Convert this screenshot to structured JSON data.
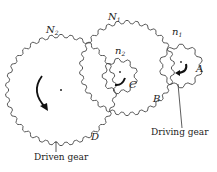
{
  "diagram": {
    "type": "gear train",
    "gears": [
      {
        "id": "N2",
        "label": "N",
        "subscript": "2",
        "role": "driven",
        "cx": 61,
        "cy": 90,
        "r": 54,
        "teeth": 34
      },
      {
        "id": "N1",
        "label": "N",
        "subscript": "1",
        "cx": 127,
        "cy": 68,
        "r": 46,
        "teeth": 30
      },
      {
        "id": "n2",
        "label": "n",
        "subscript": "2",
        "cx": 120,
        "cy": 76,
        "r": 16,
        "teeth": 9
      },
      {
        "id": "n1",
        "label": "n",
        "subscript": "1",
        "role": "driving",
        "cx": 181,
        "cy": 66,
        "r": 20,
        "teeth": 10
      }
    ],
    "points": [
      {
        "label": "A"
      },
      {
        "label": "B"
      },
      {
        "label": "C"
      },
      {
        "label": "D"
      }
    ],
    "annotations": {
      "driven": "Driven gear",
      "driving": "Driving gear"
    },
    "colors": {
      "line": "#333333",
      "text": "#222222",
      "background": "#ffffff"
    }
  }
}
